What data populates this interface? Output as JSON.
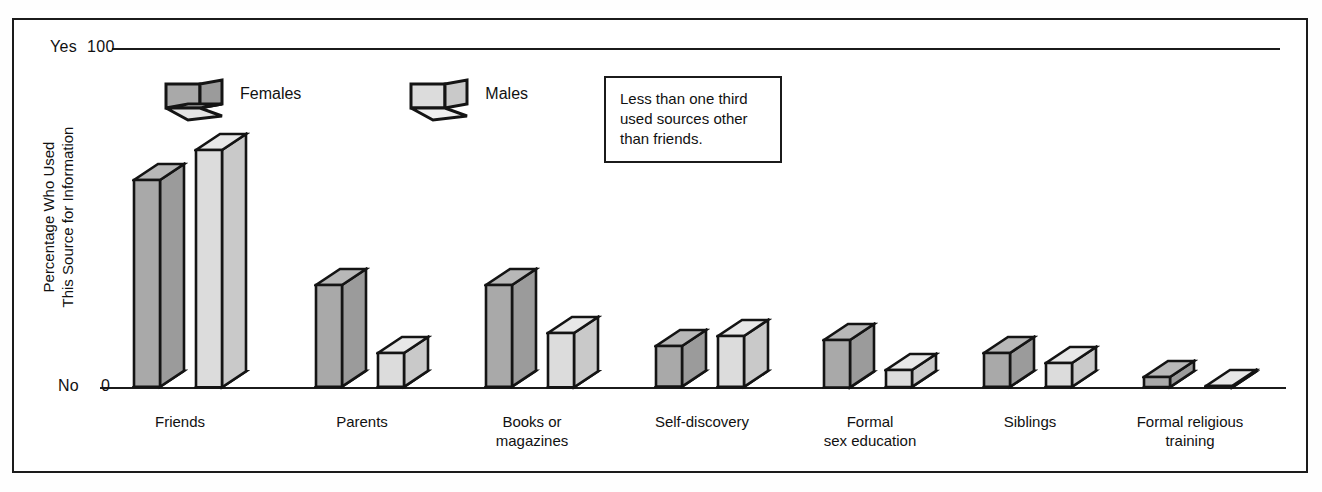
{
  "chart_data": {
    "type": "bar",
    "title": "",
    "subtitle": "",
    "xlabel": "",
    "ylabel": "Percentage Who Used\nThis Source for Information",
    "ylabel_lines": [
      "Percentage Who Used",
      "This Source for Information"
    ],
    "ylim": [
      0,
      100
    ],
    "y_ticks": [
      {
        "value": 100,
        "label": "100",
        "prefix": "Yes"
      },
      {
        "value": 0,
        "label": "0",
        "prefix": "No"
      }
    ],
    "grid": false,
    "legend_position": "top-left",
    "categories": [
      "Friends",
      "Parents",
      "Books or\nmagazines",
      "Self-discovery",
      "Formal\nsex education",
      "Siblings",
      "Formal religious\ntraining"
    ],
    "series": [
      {
        "name": "Females",
        "color": "#a9a9a9",
        "values": [
          61,
          30,
          30,
          12,
          14,
          10,
          3
        ]
      },
      {
        "name": "Males",
        "color": "#dcdcdc",
        "values": [
          70,
          10,
          16,
          15,
          5,
          7,
          0
        ]
      }
    ],
    "annotations": [
      {
        "id": "note-1",
        "text": "Less than one third\nused sources other\nthan friends.",
        "lines": [
          "Less than one third",
          "used sources other",
          "than friends."
        ]
      }
    ]
  },
  "axis": {
    "top_tick_prefix": "Yes",
    "top_tick_value": "100",
    "bottom_tick_prefix": "No",
    "bottom_tick_value": "0",
    "ylabel_line1": "Percentage Who Used",
    "ylabel_line2": "This Source for Information"
  },
  "legend": {
    "items": [
      {
        "label": "Females",
        "swatch": "female-bar-swatch"
      },
      {
        "label": "Males",
        "swatch": "male-bar-swatch"
      }
    ]
  },
  "note": {
    "line1": "Less than one third",
    "line2": "used sources other",
    "line3": "than friends."
  },
  "xlabels": [
    {
      "line1": "Friends",
      "line2": ""
    },
    {
      "line1": "Parents",
      "line2": ""
    },
    {
      "line1": "Books or",
      "line2": "magazines"
    },
    {
      "line1": "Self-discovery",
      "line2": ""
    },
    {
      "line1": "Formal",
      "line2": "sex education"
    },
    {
      "line1": "Siblings",
      "line2": ""
    },
    {
      "line1": "Formal religious",
      "line2": "training"
    }
  ],
  "colors": {
    "female_front": "#a9a9a9",
    "female_side": "#9b9b9b",
    "male_front": "#dcdcdc",
    "male_side": "#c9c9c9",
    "outline": "#141414",
    "frame": "#1b1b1b",
    "background": "#ffffff"
  }
}
